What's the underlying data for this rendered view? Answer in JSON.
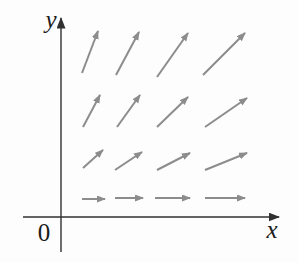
{
  "figure": {
    "background": "#fdfdfd",
    "labels": {
      "y_axis": "y",
      "x_axis": "x",
      "origin": "0"
    },
    "colors": {
      "arrow": "#8c8c8c",
      "axis": "#303030",
      "label": "#1b1b1b"
    }
  },
  "chart_data": {
    "type": "vector-field",
    "xlabel": "x",
    "ylabel": "y",
    "origin_label": "0",
    "grid": {
      "rows": 4,
      "cols": 4
    },
    "axes_px": {
      "x_axis": {
        "x1": 23,
        "y1": 217,
        "x2": 279,
        "y2": 217
      },
      "y_axis": {
        "x1": 61,
        "y1": 252,
        "x2": 61,
        "y2": 18
      }
    },
    "label_anchors_px": {
      "y_label": {
        "x": 51,
        "y": 28
      },
      "x_label": {
        "x": 272,
        "y": 238
      },
      "origin": {
        "x": 44,
        "y": 241
      }
    },
    "arrows_px": [
      {
        "row": 1,
        "col": 1,
        "x1": 82,
        "y1": 73,
        "x2": 98,
        "y2": 31
      },
      {
        "row": 1,
        "col": 2,
        "x1": 116,
        "y1": 75,
        "x2": 139,
        "y2": 32
      },
      {
        "row": 1,
        "col": 3,
        "x1": 157,
        "y1": 77,
        "x2": 188,
        "y2": 33
      },
      {
        "row": 1,
        "col": 4,
        "x1": 203,
        "y1": 75,
        "x2": 245,
        "y2": 33
      },
      {
        "row": 2,
        "col": 1,
        "x1": 83,
        "y1": 127,
        "x2": 100,
        "y2": 95
      },
      {
        "row": 2,
        "col": 2,
        "x1": 117,
        "y1": 127,
        "x2": 140,
        "y2": 95
      },
      {
        "row": 2,
        "col": 3,
        "x1": 157,
        "y1": 127,
        "x2": 188,
        "y2": 97
      },
      {
        "row": 2,
        "col": 4,
        "x1": 205,
        "y1": 127,
        "x2": 247,
        "y2": 98
      },
      {
        "row": 3,
        "col": 1,
        "x1": 83,
        "y1": 168,
        "x2": 103,
        "y2": 150
      },
      {
        "row": 3,
        "col": 2,
        "x1": 115,
        "y1": 170,
        "x2": 142,
        "y2": 152
      },
      {
        "row": 3,
        "col": 3,
        "x1": 157,
        "y1": 170,
        "x2": 190,
        "y2": 153
      },
      {
        "row": 3,
        "col": 4,
        "x1": 205,
        "y1": 170,
        "x2": 247,
        "y2": 153
      },
      {
        "row": 4,
        "col": 1,
        "x1": 82,
        "y1": 199,
        "x2": 105,
        "y2": 199
      },
      {
        "row": 4,
        "col": 2,
        "x1": 115,
        "y1": 198,
        "x2": 143,
        "y2": 198
      },
      {
        "row": 4,
        "col": 3,
        "x1": 155,
        "y1": 198,
        "x2": 190,
        "y2": 198
      },
      {
        "row": 4,
        "col": 4,
        "x1": 205,
        "y1": 198,
        "x2": 245,
        "y2": 198
      }
    ]
  }
}
